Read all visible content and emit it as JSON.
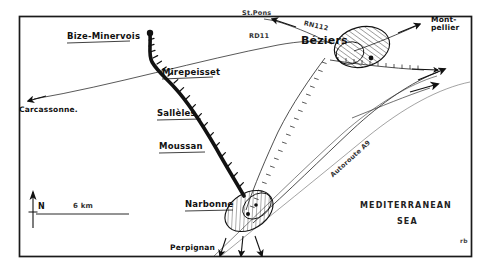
{
  "map": {
    "title": "Hand-drawn sketch map of the Narbonne–Béziers area, Languedoc, France",
    "frame_color": "#1a1a1a",
    "background_color": "#ffffff",
    "ink_color": "#111111",
    "towns": [
      {
        "id": "bize-minervois",
        "label": "Bize-Minervois",
        "x": 68,
        "y": 33
      },
      {
        "id": "mirepeisset",
        "label": "Mirepeisset",
        "x": 163,
        "y": 70
      },
      {
        "id": "salleles",
        "label": "Sallèles",
        "x": 158,
        "y": 110
      },
      {
        "id": "moussan",
        "label": "Moussan",
        "x": 160,
        "y": 143
      },
      {
        "id": "narbonne",
        "label": "Narbonne",
        "x": 186,
        "y": 200
      },
      {
        "id": "beziers",
        "label": "Béziers",
        "x": 303,
        "y": 37
      }
    ],
    "external_places": [
      {
        "id": "carcassonne",
        "label": "Carcassonne.",
        "x": 18,
        "y": 108
      },
      {
        "id": "st-pons",
        "label": "St.Pons",
        "x": 244,
        "y": 11
      },
      {
        "id": "montpellier",
        "label": "Mont-\npellier",
        "x": 432,
        "y": 18
      },
      {
        "id": "perpignan",
        "label": "Perpignan",
        "x": 171,
        "y": 248
      }
    ],
    "roads": [
      {
        "id": "rn112",
        "label": "RN112",
        "x": 312,
        "y": 16
      },
      {
        "id": "rd11",
        "label": "RD11",
        "x": 250,
        "y": 36
      },
      {
        "id": "autoroute-a9",
        "label": "Autoroute A9",
        "x": 333,
        "y": 168
      }
    ],
    "sea": {
      "label": "MEDITERRANEAN",
      "label2": "SEA",
      "x": 361,
      "y": 205
    },
    "scale_bar": {
      "label": "6 km",
      "x": 74,
      "y": 206
    },
    "north_arrow": {
      "label": "N",
      "x": 40,
      "y": 205
    },
    "signature": {
      "label": "rb",
      "x": 461,
      "y": 240
    }
  }
}
